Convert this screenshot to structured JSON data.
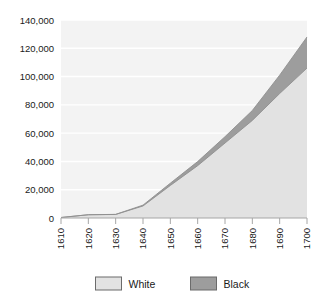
{
  "chart_data": {
    "type": "area",
    "stacked": true,
    "title": "",
    "subtitle": "",
    "xlabel": "",
    "ylabel": "",
    "x": [
      1610,
      1620,
      1630,
      1640,
      1650,
      1660,
      1670,
      1680,
      1690,
      1700
    ],
    "categories": [
      "1610",
      "1620",
      "1630",
      "1640",
      "1650",
      "1660",
      "1670",
      "1680",
      "1690",
      "1700"
    ],
    "series": [
      {
        "name": "White",
        "color": "#e2e2e2",
        "values": [
          350,
          2300,
          2500,
          8500,
          23000,
          37000,
          53000,
          69000,
          88000,
          106000
        ]
      },
      {
        "name": "Black",
        "color": "#9d9d9d",
        "values": [
          0,
          20,
          60,
          600,
          1600,
          2900,
          4500,
          7000,
          13000,
          22000
        ]
      }
    ],
    "ylim": [
      0,
      140000
    ],
    "yticks": [
      0,
      20000,
      40000,
      60000,
      80000,
      100000,
      120000,
      140000
    ],
    "ytick_labels": [
      "0",
      "20,000",
      "40,000",
      "60,000",
      "80,000",
      "100,000",
      "120,000",
      "140,000"
    ],
    "xlim": [
      1610,
      1700
    ],
    "xticks": [
      1610,
      1620,
      1630,
      1640,
      1650,
      1660,
      1670,
      1680,
      1690,
      1700
    ],
    "xtick_labels": [
      "1610",
      "1620",
      "1630",
      "1640",
      "1650",
      "1660",
      "1670",
      "1680",
      "1690",
      "1700"
    ],
    "xtick_rotation": -90,
    "grid": {
      "horizontal": true,
      "vertical": false,
      "color": "#ffffff"
    },
    "plot_background": "#f3f3f3",
    "legend": {
      "position": "bottom",
      "entries": [
        {
          "label": "White",
          "color": "#e2e2e2"
        },
        {
          "label": "Black",
          "color": "#9d9d9d"
        }
      ]
    }
  }
}
